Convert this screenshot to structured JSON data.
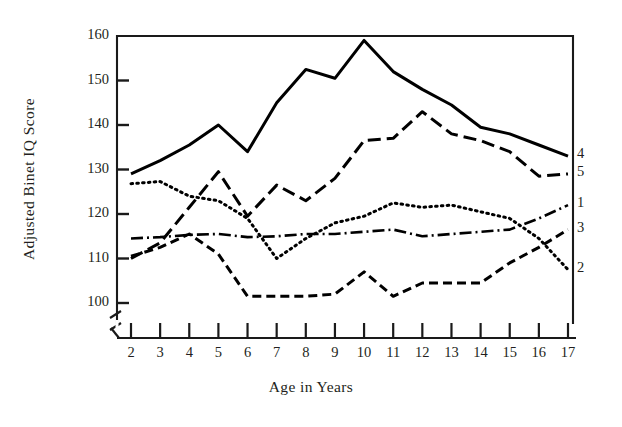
{
  "chart_data": {
    "type": "line",
    "title": "",
    "xlabel": "Age in Years",
    "ylabel": "Adjusted Binet IQ Score",
    "x": [
      2,
      3,
      4,
      5,
      6,
      7,
      8,
      9,
      10,
      11,
      12,
      13,
      14,
      15,
      16,
      17
    ],
    "xtick_labels": [
      "2",
      "3",
      "4",
      "5",
      "6",
      "7",
      "8",
      "9",
      "10",
      "11",
      "12",
      "13",
      "14",
      "15",
      "16",
      "17"
    ],
    "ytick_labels": [
      "100",
      "110",
      "120",
      "130",
      "140",
      "150",
      "160"
    ],
    "ytick_values": [
      100,
      110,
      120,
      130,
      140,
      150,
      160
    ],
    "xlim": [
      2,
      17
    ],
    "ylim": [
      99,
      161
    ],
    "grid": false,
    "legend_position": "right-end-of-line",
    "axis_break": {
      "axis": "y",
      "below": 100,
      "note": "broken axis symbol at base of y-axis"
    },
    "series": [
      {
        "name": "1",
        "label": "1",
        "style": "dash-dot",
        "color": "#000000",
        "values": [
          114.5,
          114.8,
          115.3,
          115.5,
          114.8,
          115.0,
          115.5,
          115.5,
          116.0,
          116.5,
          115.0,
          115.5,
          116.0,
          116.5,
          119.0,
          122.0
        ]
      },
      {
        "name": "2",
        "label": "2",
        "style": "dotted",
        "color": "#000000",
        "values": [
          126.8,
          127.3,
          124.0,
          123.0,
          119.0,
          110.0,
          114.5,
          118.0,
          119.5,
          122.5,
          121.5,
          122.0,
          120.5,
          119.0,
          114.5,
          107.5
        ]
      },
      {
        "name": "3",
        "label": "3",
        "style": "dashed",
        "color": "#000000",
        "values": [
          110.5,
          112.5,
          115.5,
          111.0,
          101.5,
          101.5,
          101.5,
          102.0,
          107.0,
          101.5,
          104.5,
          104.5,
          104.5,
          109.0,
          112.5,
          116.5
        ]
      },
      {
        "name": "4",
        "label": "4",
        "style": "solid",
        "color": "#000000",
        "values": [
          129.0,
          132.0,
          135.5,
          140.0,
          134.0,
          145.0,
          152.5,
          150.5,
          159.0,
          152.0,
          148.0,
          144.5,
          139.5,
          138.0,
          135.5,
          133.0
        ]
      },
      {
        "name": "5",
        "label": "5",
        "style": "long-dash",
        "color": "#000000",
        "values": [
          110.0,
          113.5,
          121.5,
          129.5,
          119.5,
          126.5,
          123.0,
          128.0,
          136.5,
          137.0,
          143.0,
          138.0,
          136.5,
          134.0,
          128.5,
          129.0
        ]
      }
    ]
  }
}
